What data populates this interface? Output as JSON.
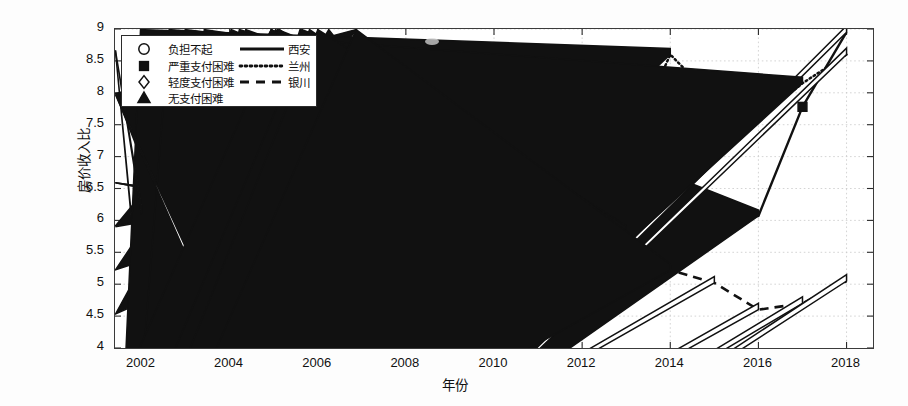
{
  "axes": {
    "ylabel": "房价收入比",
    "xlabel": "年份",
    "ylim": [
      4,
      9
    ],
    "yticks": [
      "4",
      "4.5",
      "5",
      "5.5",
      "6",
      "6.5",
      "7",
      "7.5",
      "8",
      "8.5",
      "9"
    ],
    "xlim": [
      2001.4,
      2018.6
    ],
    "xticks": [
      "2002",
      "2004",
      "2006",
      "2008",
      "2010",
      "2012",
      "2014",
      "2016",
      "2018"
    ],
    "grid": true
  },
  "legend": {
    "position": "upper-left",
    "marker_entries": [
      {
        "marker": "circle-open-marker",
        "label": "负担不起"
      },
      {
        "marker": "square-filled-marker",
        "label": "严重支付困难"
      },
      {
        "marker": "diamond-open-marker",
        "label": "轻度支付困难"
      },
      {
        "marker": "triangle-filled-marker",
        "label": "无支付困难"
      }
    ],
    "line_entries": [
      {
        "style": "solid-line",
        "label": "西安"
      },
      {
        "style": "dotted-line",
        "label": "兰州"
      },
      {
        "style": "dashed-line",
        "label": "银川"
      }
    ]
  },
  "chart_data": {
    "type": "line",
    "title": "",
    "xlabel": "年份",
    "ylabel": "房价收入比",
    "xlim": [
      2001.4,
      2018.6
    ],
    "ylim": [
      4,
      9
    ],
    "grid": true,
    "legend_position": "upper-left",
    "x": [
      2002,
      2003,
      2004,
      2005,
      2006,
      2007,
      2008,
      2009,
      2010,
      2011,
      2012,
      2013,
      2014,
      2015,
      2016,
      2017,
      2018
    ],
    "marker_legend": {
      "circle": "负担不起",
      "square": "严重支付困难",
      "diamond": "轻度支付困难",
      "triangle": "无支付困难"
    },
    "series": [
      {
        "name": "西安",
        "line_style": "solid",
        "values": [
          5.45,
          5.22,
          5.78,
          6.13,
          6.45,
          6.05,
          6.55,
          5.65,
          5.65,
          6.55,
          6.95,
          6.55,
          6.45,
          6.1,
          6.07,
          7.78,
          8.95
        ],
        "markers": [
          "circle",
          "triangle",
          "square",
          "diamond",
          "triangle",
          "circle",
          "triangle",
          "circle",
          "triangle",
          "triangle",
          "triangle",
          "circle",
          "triangle",
          "triangle",
          "triangle",
          "square",
          "diamond"
        ]
      },
      {
        "name": "兰州",
        "line_style": "dotted",
        "values": [
          4.35,
          4.78,
          5.78,
          6.13,
          6.45,
          6.48,
          6.2,
          6.52,
          7.18,
          6.55,
          7.53,
          7.05,
          8.6,
          7.9,
          7.6,
          8.15,
          8.6
        ],
        "markers": [
          "diamond",
          "square",
          "square",
          "diamond",
          "diamond",
          "triangle",
          "circle",
          "circle",
          "triangle",
          "triangle",
          "diamond",
          "triangle",
          "triangle",
          "triangle",
          "triangle",
          "triangle",
          "diamond"
        ]
      },
      {
        "name": "银川",
        "line_style": "dashed",
        "values": [
          6.12,
          5.48,
          5.72,
          5.82,
          5.7,
          4.98,
          5.2,
          5.95,
          6.42,
          6.28,
          5.95,
          5.82,
          5.22,
          5.02,
          4.6,
          4.7,
          5.05
        ],
        "markers": [
          "diamond",
          "diamond",
          "square",
          "square",
          "square",
          "square",
          "square",
          "diamond",
          "triangle",
          "circle",
          "triangle",
          "triangle",
          "triangle",
          "diamond",
          "diamond",
          "diamond",
          "diamond"
        ]
      }
    ]
  }
}
